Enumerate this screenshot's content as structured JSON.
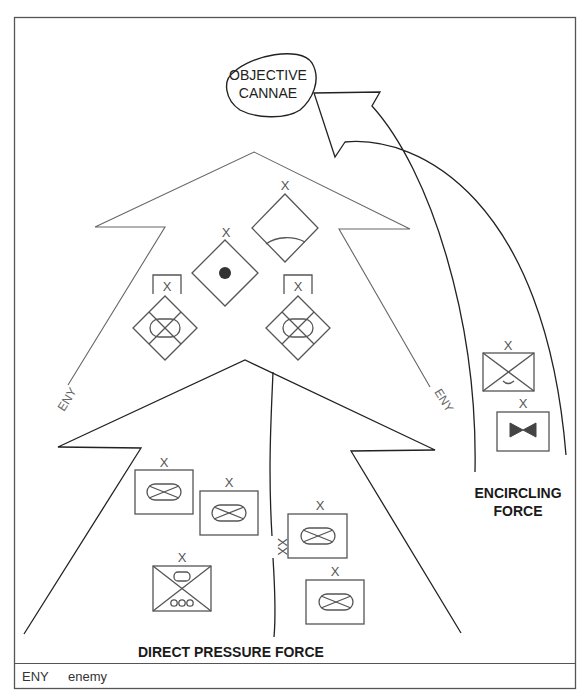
{
  "diagram": {
    "objective": {
      "line1": "OBJECTIVE",
      "line2": "CANNAE"
    },
    "enemy_label": "ENY",
    "echelon_brigade": "X",
    "echelon_division": "XX",
    "forces": {
      "direct_pressure": "DIRECT PRESSURE FORCE",
      "encircling_line1": "ENCIRCLING",
      "encircling_line2": "FORCE"
    },
    "enemy_units": [
      {
        "symbol": "diamond-dot",
        "echelon": "X"
      },
      {
        "symbol": "diamond-arc",
        "echelon": "X"
      },
      {
        "symbol": "diamond-armored-infantry-bracketed",
        "echelon": "X"
      },
      {
        "symbol": "diamond-armored-infantry-bracketed",
        "echelon": "X"
      }
    ],
    "direct_pressure_units": [
      {
        "symbol": "armored-infantry",
        "echelon": "X"
      },
      {
        "symbol": "armored-infantry",
        "echelon": "X"
      },
      {
        "symbol": "armored-infantry",
        "echelon": "X"
      },
      {
        "symbol": "armored-infantry",
        "echelon": "X"
      },
      {
        "symbol": "armored-wheeled-infantry",
        "echelon": "X"
      }
    ],
    "encircling_units": [
      {
        "symbol": "airborne-infantry",
        "echelon": "X"
      },
      {
        "symbol": "engineer-bowtie",
        "echelon": "X"
      }
    ],
    "legend": {
      "key": "ENY",
      "value": "enemy"
    },
    "colors": {
      "line": "#333333",
      "symbol": "#555555",
      "fill_dot": "#333333",
      "bowtie": "#444444",
      "background": "#ffffff"
    }
  }
}
